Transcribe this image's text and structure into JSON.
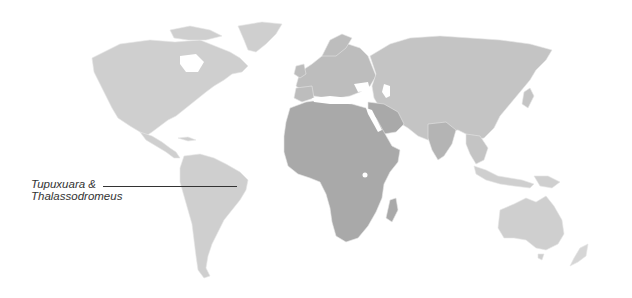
{
  "map": {
    "type": "world-map",
    "colors": {
      "background": "#ffffff",
      "land_light": "#cfcfcf",
      "land_mid": "#bdbdbd",
      "land_dark": "#a9a9a9",
      "border": "#e6e6e6",
      "leader": "#333333",
      "label": "#333333"
    },
    "annotation": {
      "line1": "Tupuxuara &",
      "line2": "Thalassodromeus",
      "points_to": "north-eastern Brazil"
    }
  }
}
